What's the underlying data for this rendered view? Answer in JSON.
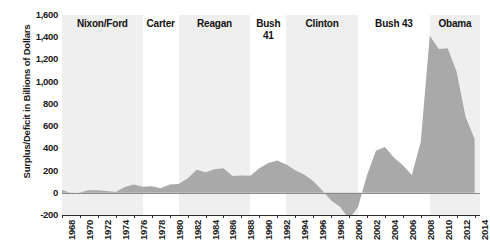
{
  "chart_data": {
    "type": "area",
    "title": "",
    "xlabel": "",
    "ylabel": "Surplus/Deficit in Billions of Dollars",
    "ylim": [
      -200,
      1600
    ],
    "xlim": [
      1968,
      2014
    ],
    "ytick_labels": [
      "1,600",
      "1,400",
      "1,200",
      "1,000",
      "800",
      "600",
      "400",
      "200",
      "0",
      "-200"
    ],
    "ytick_values": [
      1600,
      1400,
      1200,
      1000,
      800,
      600,
      400,
      200,
      0,
      -200
    ],
    "xtick_labels": [
      "1968",
      "1970",
      "1972",
      "1974",
      "1976",
      "1978",
      "1980",
      "1982",
      "1984",
      "1986",
      "1988",
      "1990",
      "1992",
      "1994",
      "1996",
      "1998",
      "2000",
      "2002",
      "2004",
      "2006",
      "2008",
      "2010",
      "2012",
      "2014"
    ],
    "xtick_values": [
      1968,
      1970,
      1972,
      1974,
      1976,
      1978,
      1980,
      1982,
      1984,
      1986,
      1988,
      1990,
      1992,
      1994,
      1996,
      1998,
      2000,
      2002,
      2004,
      2006,
      2008,
      2010,
      2012,
      2014
    ],
    "grid": false,
    "legend": "none",
    "series_name": "Deficit",
    "fill_color": "#a9a9a9",
    "x": [
      1968,
      1969,
      1970,
      1971,
      1972,
      1973,
      1974,
      1975,
      1976,
      1977,
      1978,
      1979,
      1980,
      1981,
      1982,
      1983,
      1984,
      1985,
      1986,
      1987,
      1988,
      1989,
      1990,
      1991,
      1992,
      1993,
      1994,
      1995,
      1996,
      1997,
      1998,
      1999,
      2000,
      2001,
      2002,
      2003,
      2004,
      2005,
      2006,
      2007,
      2008,
      2009,
      2010,
      2011,
      2012,
      2013,
      2014
    ],
    "values": [
      25,
      -3,
      3,
      23,
      23,
      15,
      6,
      53,
      74,
      54,
      59,
      41,
      74,
      79,
      128,
      208,
      185,
      212,
      221,
      150,
      155,
      153,
      221,
      269,
      290,
      255,
      203,
      164,
      107,
      22,
      -69,
      -126,
      -236,
      -128,
      158,
      378,
      413,
      318,
      248,
      161,
      459,
      1413,
      1294,
      1300,
      1087,
      680,
      485
    ],
    "eras": [
      {
        "label": "Nixon/Ford",
        "start": 1968,
        "end": 1977,
        "shaded": true
      },
      {
        "label": "Carter",
        "start": 1977,
        "end": 1981,
        "shaded": false
      },
      {
        "label": "Reagan",
        "start": 1981,
        "end": 1989,
        "shaded": true
      },
      {
        "label": "Bush\n41",
        "start": 1989,
        "end": 1993,
        "shaded": false
      },
      {
        "label": "Clinton",
        "start": 1993,
        "end": 2001,
        "shaded": true
      },
      {
        "label": "Bush 43",
        "start": 2001,
        "end": 2009,
        "shaded": false
      },
      {
        "label": "Obama",
        "start": 2009,
        "end": 2014.6,
        "shaded": true
      }
    ]
  }
}
